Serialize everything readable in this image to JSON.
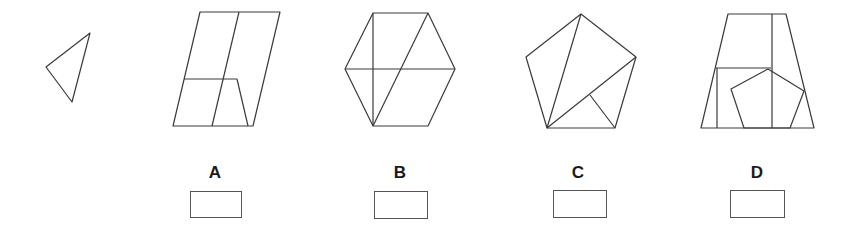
{
  "question": {
    "reference_shape": "triangle",
    "options": [
      {
        "label": "A",
        "shape": "parallelogram-with-inner-lines"
      },
      {
        "label": "B",
        "shape": "hexagon-with-inner-lines"
      },
      {
        "label": "C",
        "shape": "pentagon-with-inner-lines"
      },
      {
        "label": "D",
        "shape": "trapezoid-with-pentagon"
      }
    ]
  },
  "colors": {
    "stroke": "#3a3a3a",
    "background": "#ffffff"
  }
}
